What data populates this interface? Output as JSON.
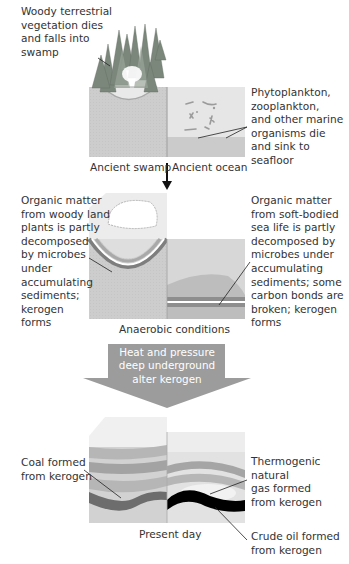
{
  "diagram": {
    "stage1": {
      "left_label": "Woody terrestrial\nvegetation dies\nand falls into\nswamp",
      "right_label": "Phytoplankton,\nzooplankton,\nand other marine\norganisms die\nand sink to\nseafloor",
      "caption_left": "Ancient swamp",
      "caption_right": "Ancient ocean"
    },
    "stage2": {
      "left_label": "Organic matter\nfrom woody land\nplants is partly\ndecomposed\nby microbes\nunder\naccumulating\nsediments;\nkerogen\nforms",
      "right_label": "Organic matter\nfrom soft-bodied\nsea life is partly\ndecomposed by\nmicrobes under\naccumulating\nsediments; some\ncarbon bonds are\nbroken; kerogen\nforms",
      "caption": "Anaerobic conditions"
    },
    "process_arrow": {
      "text": "Heat and pressure\ndeep underground\nalter kerogen"
    },
    "stage3": {
      "coal_label": "Coal formed\nfrom kerogen",
      "gas_label": "Thermogenic\nnatural\ngas formed\nfrom kerogen",
      "oil_label": "Crude oil formed\nfrom kerogen",
      "caption": "Present day"
    },
    "colors": {
      "swamp_water": "#cfcfcf",
      "ocean_water": "#e6e6e6",
      "ocean_floor": "#c8c8c8",
      "sediment_light": "#d7d7d7",
      "layer_dark": "#8d8d8d",
      "layer_mid": "#a9a9a9",
      "coal": "#6f6f6f",
      "oil": "#000000",
      "arrow": "#9a9a9a",
      "trees": "#7f8a7f"
    }
  }
}
